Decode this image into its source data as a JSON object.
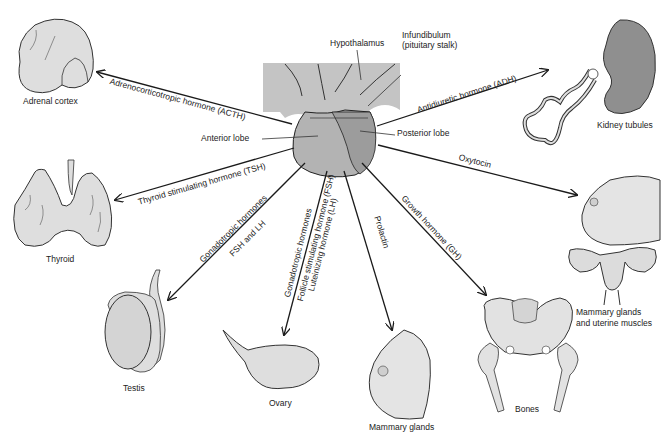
{
  "pituitary": {
    "hypothalamus": "Hypothalamus",
    "infundibulum_line1": "Infundibulum",
    "infundibulum_line2": "(pituitary stalk)",
    "anterior_lobe": "Anterior lobe",
    "posterior_lobe": "Posterior lobe"
  },
  "hormones": {
    "acth": "Adrenocorticotropic hormone (ACTH)",
    "tsh": "Thyroid stimulating hormone (TSH)",
    "gonado_testis_line1": "Gonadotropic hormones",
    "gonado_testis_line2": "FSH and LH",
    "gonado_ovary_line1": "Gonadotropic hormones",
    "gonado_ovary_line2": "Follicle stimulating hormone (FSH)",
    "gonado_ovary_line3": "Luteinizing hormone (LH)",
    "prolactin": "Prolactin",
    "gh": "Growth hormone (GH)",
    "adh": "Antidiuretic hormone (ADH)",
    "oxytocin": "Oxytocin"
  },
  "targets": {
    "adrenal": "Adrenal cortex",
    "thyroid": "Thyroid",
    "testis": "Testis",
    "ovary": "Ovary",
    "mammary": "Mammary glands",
    "bones": "Bones",
    "kidney": "Kidney tubules",
    "mammary_uterine_line1": "Mammary glands",
    "mammary_uterine_line2": "and uterine muscles"
  },
  "colors": {
    "hypothalamus_fill": "#c4c4c4",
    "anterior_fill": "#b3b3b3",
    "posterior_fill": "#9c9c9c",
    "organ_fill": "#dedede",
    "kidney_fill": "#8f8f8f",
    "line": "#1a1a1a"
  }
}
